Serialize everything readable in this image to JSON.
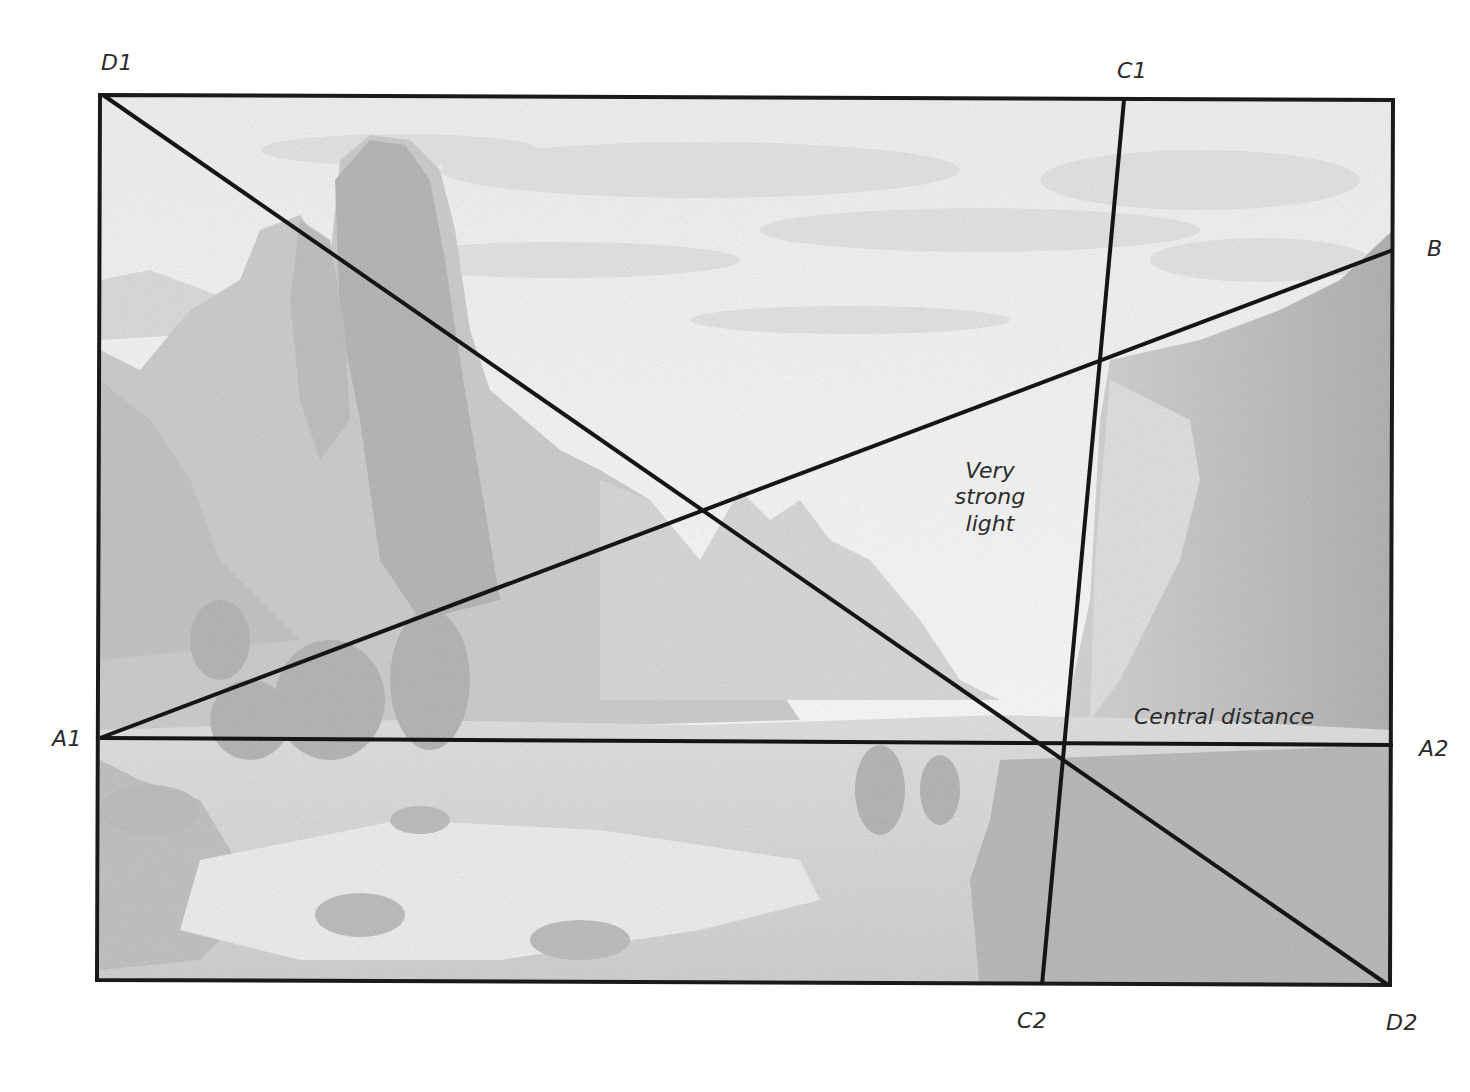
{
  "figure": {
    "type": "composition-analysis-diagram",
    "colors": {
      "line": "#151515",
      "frame": "#1a1a1a",
      "paper": "#ffffff",
      "pencil_light": "#e6e6e6",
      "pencil_mid": "#c9c9c9",
      "pencil_dark": "#a9a9a9",
      "label": "#2a2a2a"
    }
  },
  "point_labels": {
    "d1": "D1",
    "c1": "C1",
    "b": "B",
    "a1": "A1",
    "a2": "A2",
    "c2": "C2",
    "d2": "D2"
  },
  "lines": [
    {
      "id": "D1-D2",
      "from": "D1",
      "to": "D2",
      "kind": "diagonal"
    },
    {
      "id": "A1-A2",
      "from": "A1",
      "to": "A2",
      "kind": "horizon"
    },
    {
      "id": "A1-B",
      "from": "A1",
      "to": "B",
      "kind": "rising diagonal"
    },
    {
      "id": "C1-C2",
      "from": "C1",
      "to": "C2",
      "kind": "near-vertical"
    }
  ],
  "annotations": {
    "strong_light": {
      "line1": "Very",
      "line2": "strong",
      "line3": "light"
    },
    "central_distance": "Central distance"
  }
}
